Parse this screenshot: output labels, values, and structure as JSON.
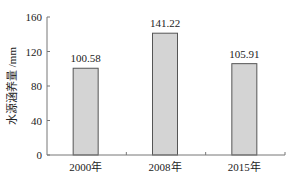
{
  "chart_data": {
    "type": "bar",
    "title": "",
    "xlabel": "",
    "ylabel": "水源涵养量 /mm",
    "categories": [
      "2000年",
      "2008年",
      "2015年"
    ],
    "values": [
      100.58,
      141.22,
      105.91
    ],
    "data_labels": [
      "100.58",
      "141.22",
      "105.91"
    ],
    "ylim": [
      0,
      160
    ],
    "yticks": [
      0,
      40,
      80,
      120,
      160
    ],
    "ytick_labels": [
      "0",
      "40",
      "80",
      "120",
      "160"
    ],
    "grid": false,
    "legend": null,
    "colors": {
      "bar_fill": "#d4d4d4",
      "bar_edge": "#555555",
      "axis": "#777777"
    }
  }
}
